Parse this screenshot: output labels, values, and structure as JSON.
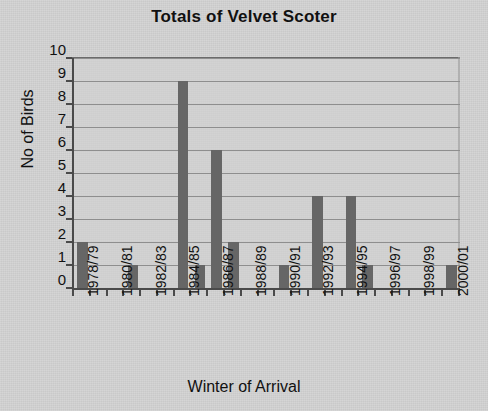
{
  "chart_data": {
    "type": "bar",
    "title": "Totals of Velvet Scoter",
    "xlabel": "Winter of Arrival",
    "ylabel": "No of Birds",
    "ylim": [
      0,
      10
    ],
    "ytick_values": [
      0,
      1,
      2,
      3,
      4,
      5,
      6,
      7,
      8,
      9,
      10
    ],
    "grid": true,
    "legend": null,
    "bar_color": "#666666",
    "plot_background": "#d2d2d2",
    "categories": [
      "1978/79",
      "1979/80",
      "1980/81",
      "1981/82",
      "1982/83",
      "1983/84",
      "1984/85",
      "1985/86",
      "1986/87",
      "1987/88",
      "1988/89",
      "1989/90",
      "1990/91",
      "1991/92",
      "1992/93",
      "1993/94",
      "1994/95",
      "1995/96",
      "1996/97",
      "1997/98",
      "1998/99",
      "1999/00",
      "2000/01"
    ],
    "values": [
      2,
      0,
      0,
      1,
      0,
      0,
      9,
      1,
      6,
      2,
      0,
      0,
      1,
      0,
      4,
      0,
      4,
      1,
      0,
      0,
      0,
      0,
      1
    ],
    "tick_label_every": 2,
    "visible_xtick_labels": [
      "1978/79",
      "1980/81",
      "1982/83",
      "1984/85",
      "1986/87",
      "1988/89",
      "1990/91",
      "1992/93",
      "1994/95",
      "1996/97",
      "1998/99",
      "2000/01"
    ]
  }
}
